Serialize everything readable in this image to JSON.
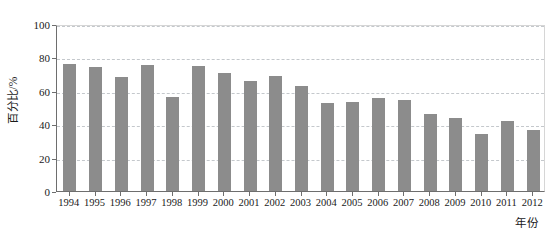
{
  "chart_data": {
    "type": "bar",
    "title": "",
    "subtitle": "",
    "xlabel": "年份",
    "ylabel": "百分比/%",
    "categories": [
      "1994",
      "1995",
      "1996",
      "1997",
      "1998",
      "1999",
      "2000",
      "2001",
      "2002",
      "2003",
      "2004",
      "2005",
      "2006",
      "2007",
      "2008",
      "2009",
      "2010",
      "2011",
      "2012"
    ],
    "values": [
      76,
      74,
      68,
      75.5,
      56,
      75,
      70.5,
      66,
      69,
      63,
      53,
      53.5,
      55.5,
      54.5,
      46,
      44,
      34,
      42,
      36.5
    ],
    "series": [
      {
        "name": "百分比",
        "values": [
          76,
          74,
          68,
          75.5,
          56,
          75,
          70.5,
          66,
          69,
          63,
          53,
          53.5,
          55.5,
          54.5,
          46,
          44,
          34,
          42,
          36.5
        ]
      }
    ],
    "ylim": [
      0,
      100
    ],
    "yticks": [
      0,
      20,
      40,
      60,
      80,
      100
    ],
    "ytick_labels": [
      "0",
      "20",
      "40",
      "60",
      "80",
      "100"
    ],
    "grid": true,
    "grid_axis": "y",
    "grid_style": "dashed",
    "legend": false,
    "legend_position": "none",
    "bar_color": "#8c8c8c",
    "grid_color": "#c4c8cc",
    "axis_color": "#6e6e6e",
    "text_color": "#1a1a1a",
    "background_color": "#ffffff"
  }
}
